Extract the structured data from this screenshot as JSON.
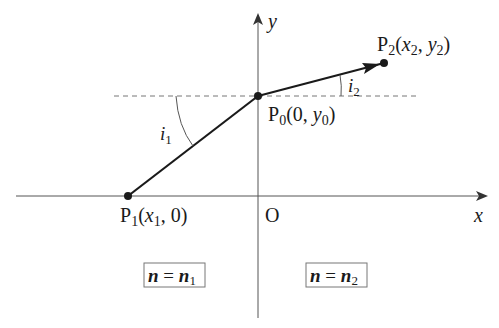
{
  "diagram": {
    "type": "refraction-ray-diagram",
    "axes": {
      "x_label": "x",
      "y_label": "y",
      "origin_label": "O"
    },
    "points": {
      "p0": {
        "name": "P",
        "sub": "0",
        "coords_open": "(0, ",
        "coord_var": "y",
        "coord_sub": "0",
        "coords_close": ")"
      },
      "p1": {
        "name": "P",
        "sub": "1",
        "coords_open": "(",
        "coord_var": "x",
        "coord_sub": "1",
        "coords_close": ", 0)"
      },
      "p2": {
        "name": "P",
        "sub": "2",
        "coords_open": "(",
        "coord_var1": "x",
        "coord_sub1": "2",
        "sep": ", ",
        "coord_var2": "y",
        "coord_sub2": "2",
        "coords_close": ")"
      }
    },
    "angles": {
      "i1": {
        "var": "i",
        "sub": "1"
      },
      "i2": {
        "var": "i",
        "sub": "2"
      }
    },
    "regions": {
      "left": {
        "lhs": "n",
        "eq": " = ",
        "rhs": "n",
        "sub": "1"
      },
      "right": {
        "lhs": "n",
        "eq": " = ",
        "rhs": "n",
        "sub": "2"
      }
    },
    "colors": {
      "ray": "#1a1a1a",
      "axis": "#555555",
      "dashed": "#777777",
      "text": "#1a1a1a",
      "box_border": "#777777"
    }
  }
}
